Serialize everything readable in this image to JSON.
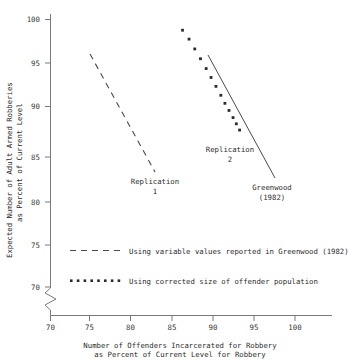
{
  "chart_data": {
    "type": "line",
    "title": "",
    "xlabel": "Number of Offenders Incarcerated for Robbery as Percent of Current Level for Robbery",
    "ylabel": "Expected Number of Adult Armed Robberies as Percent of Current Level",
    "xlim": [
      70,
      101.5
    ],
    "ylim": [
      70,
      101.5
    ],
    "xticks": [
      70,
      75,
      80,
      85,
      90,
      95,
      100
    ],
    "yticks": [
      70,
      75,
      80,
      85,
      90,
      95,
      100
    ],
    "grid": false,
    "y_axis_break": true,
    "legend_position": "inside-lower-left",
    "series": [
      {
        "name": "Replication 1",
        "style": "dashed",
        "x": [
          74.9,
          82.8
        ],
        "y": [
          97.5,
          83.9
        ]
      },
      {
        "name": "Replication 2",
        "style": "dotted",
        "x": [
          86.2,
          87.0,
          87.7,
          88.4,
          89.1,
          89.7,
          90.3,
          90.9,
          91.4,
          91.9,
          92.4,
          92.8,
          93.2
        ],
        "y": [
          98.8,
          97.8,
          96.7,
          95.6,
          94.5,
          93.5,
          92.5,
          91.5,
          90.6,
          89.8,
          89.0,
          88.3,
          87.6
        ]
      },
      {
        "name": "Greenwood (1982)",
        "style": "solid",
        "x": [
          89.3,
          97.4
        ],
        "y": [
          97.4,
          83.2
        ]
      }
    ],
    "annotations": [
      {
        "text_line1": "Replication",
        "text_line2": "1",
        "x": 81.0,
        "y": 81.6
      },
      {
        "text_line1": "Replication",
        "text_line2": "2",
        "x": 91.4,
        "y": 85.9
      },
      {
        "text_line1": "Greenwood",
        "text_line2": "(1982)",
        "x": 97.2,
        "y": 81.0
      }
    ],
    "legend_entries": [
      {
        "marker": "dashed-line",
        "label": "Using variable values reported in Greenwood (1982)"
      },
      {
        "marker": "dotted-line",
        "label": "Using corrected size of offender population"
      }
    ]
  },
  "axis": {
    "y_title_line1": "Expected Number of Adult Armed Robberies",
    "y_title_line2": "as Percent of Current Level",
    "x_title_line1": "Number of Offenders Incarcerated for Robbery",
    "x_title_line2": "as Percent of Current Level for Robbery",
    "xtick_labels": [
      "70",
      "75",
      "80",
      "85",
      "90",
      "95",
      "100"
    ],
    "ytick_labels": [
      "70",
      "75",
      "80",
      "85",
      "90",
      "95",
      "100"
    ]
  }
}
